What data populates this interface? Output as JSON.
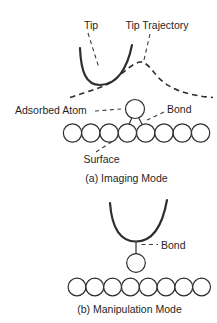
{
  "figure": {
    "colors": {
      "background": "#ffffff",
      "line": "#2e2e2e",
      "text": "#1f1f1f"
    },
    "imaging": {
      "tip_label": "Tip",
      "tip_trajectory_label": "Tip Trajectory",
      "adsorbed_atom_label": "Adsorbed Atom",
      "bond_label": "Bond",
      "surface_label": "Surface",
      "caption": "(a) Imaging Mode",
      "surface_atom_count": 8,
      "adsorbed_atom_count": 1
    },
    "manipulation": {
      "bond_label": "Bond",
      "caption": "(b) Manipulation Mode",
      "surface_atom_count": 8,
      "adsorbed_atom_count": 1
    }
  }
}
